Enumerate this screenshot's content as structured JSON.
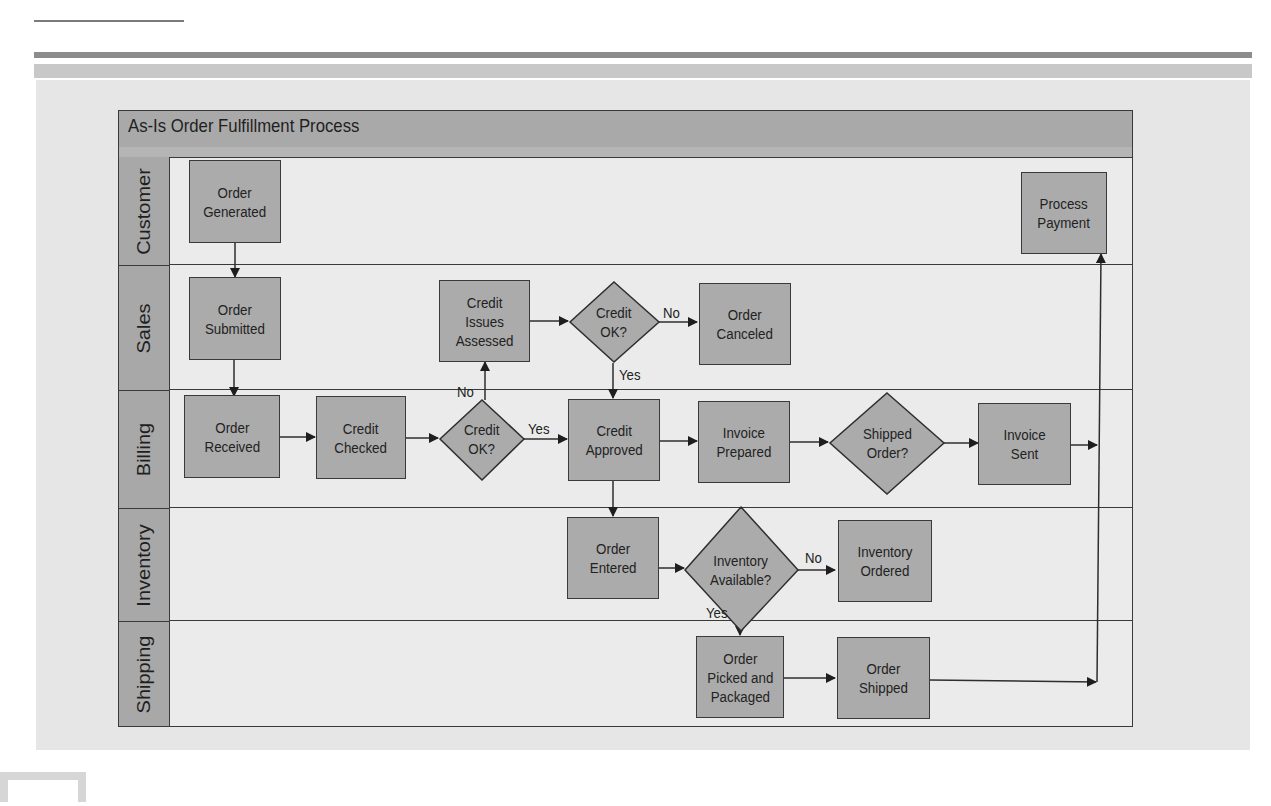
{
  "diagram": {
    "title": "As-Is Order Fulfillment Process",
    "lanes": [
      {
        "id": "customer",
        "label": "Customer"
      },
      {
        "id": "sales",
        "label": "Sales"
      },
      {
        "id": "billing",
        "label": "Billing"
      },
      {
        "id": "inventory",
        "label": "Inventory"
      },
      {
        "id": "shipping",
        "label": "Shipping"
      }
    ],
    "nodes": {
      "order_generated": {
        "lane": "Customer",
        "type": "process",
        "label": "Order\nGenerated"
      },
      "process_payment": {
        "lane": "Customer",
        "type": "process",
        "label": "Process\nPayment"
      },
      "order_submitted": {
        "lane": "Sales",
        "type": "process",
        "label": "Order\nSubmitted"
      },
      "credit_issues_assessed": {
        "lane": "Sales",
        "type": "process",
        "label": "Credit\nIssues\nAssessed"
      },
      "credit_ok_sales": {
        "lane": "Sales",
        "type": "decision",
        "label": "Credit\nOK?"
      },
      "order_canceled": {
        "lane": "Sales",
        "type": "process",
        "label": "Order\nCanceled"
      },
      "order_received": {
        "lane": "Billing",
        "type": "process",
        "label": "Order\nReceived"
      },
      "credit_checked": {
        "lane": "Billing",
        "type": "process",
        "label": "Credit\nChecked"
      },
      "credit_ok_billing": {
        "lane": "Billing",
        "type": "decision",
        "label": "Credit\nOK?"
      },
      "credit_approved": {
        "lane": "Billing",
        "type": "process",
        "label": "Credit\nApproved"
      },
      "invoice_prepared": {
        "lane": "Billing",
        "type": "process",
        "label": "Invoice\nPrepared"
      },
      "shipped_order": {
        "lane": "Billing",
        "type": "decision",
        "label": "Shipped\nOrder?"
      },
      "invoice_sent": {
        "lane": "Billing",
        "type": "process",
        "label": "Invoice\nSent"
      },
      "order_entered": {
        "lane": "Inventory",
        "type": "process",
        "label": "Order\nEntered"
      },
      "inventory_available": {
        "lane": "Inventory",
        "type": "decision",
        "label": "Inventory\nAvailable?"
      },
      "inventory_ordered": {
        "lane": "Inventory",
        "type": "process",
        "label": "Inventory\nOrdered"
      },
      "order_picked_packaged": {
        "lane": "Shipping",
        "type": "process",
        "label": "Order\nPicked and\nPackaged"
      },
      "order_shipped": {
        "lane": "Shipping",
        "type": "process",
        "label": "Order\nShipped"
      }
    },
    "edge_labels": {
      "billing_credit_no": "No",
      "billing_credit_yes": "Yes",
      "sales_credit_no": "No",
      "sales_credit_yes": "Yes",
      "inventory_no": "No",
      "inventory_yes": "Yes"
    },
    "edges": [
      {
        "from": "Order Generated",
        "to": "Order Submitted"
      },
      {
        "from": "Order Submitted",
        "to": "Order Received"
      },
      {
        "from": "Order Received",
        "to": "Credit Checked"
      },
      {
        "from": "Credit Checked",
        "to": "Credit OK? (Billing)"
      },
      {
        "from": "Credit OK? (Billing)",
        "to": "Credit Approved",
        "label": "Yes"
      },
      {
        "from": "Credit OK? (Billing)",
        "to": "Credit Issues Assessed",
        "label": "No"
      },
      {
        "from": "Credit Issues Assessed",
        "to": "Credit OK? (Sales)"
      },
      {
        "from": "Credit OK? (Sales)",
        "to": "Order Canceled",
        "label": "No"
      },
      {
        "from": "Credit OK? (Sales)",
        "to": "Credit Approved",
        "label": "Yes"
      },
      {
        "from": "Credit Approved",
        "to": "Invoice Prepared"
      },
      {
        "from": "Credit Approved",
        "to": "Order Entered"
      },
      {
        "from": "Invoice Prepared",
        "to": "Shipped Order?"
      },
      {
        "from": "Shipped Order?",
        "to": "Invoice Sent"
      },
      {
        "from": "Invoice Sent",
        "to": "Process Payment"
      },
      {
        "from": "Order Entered",
        "to": "Inventory Available?"
      },
      {
        "from": "Inventory Available?",
        "to": "Inventory Ordered",
        "label": "No"
      },
      {
        "from": "Inventory Available?",
        "to": "Order Picked and Packaged",
        "label": "Yes"
      },
      {
        "from": "Order Picked and Packaged",
        "to": "Order Shipped"
      },
      {
        "from": "Order Shipped",
        "to": "Process Payment"
      }
    ]
  },
  "colors": {
    "title_bar": "#a9a9a9",
    "lane_label": "#a8a8a8",
    "node_fill": "#ababab",
    "lane_bg": "#ebebeb",
    "stroke": "#3a3a3a",
    "page_panel": "#e6e6e6"
  }
}
